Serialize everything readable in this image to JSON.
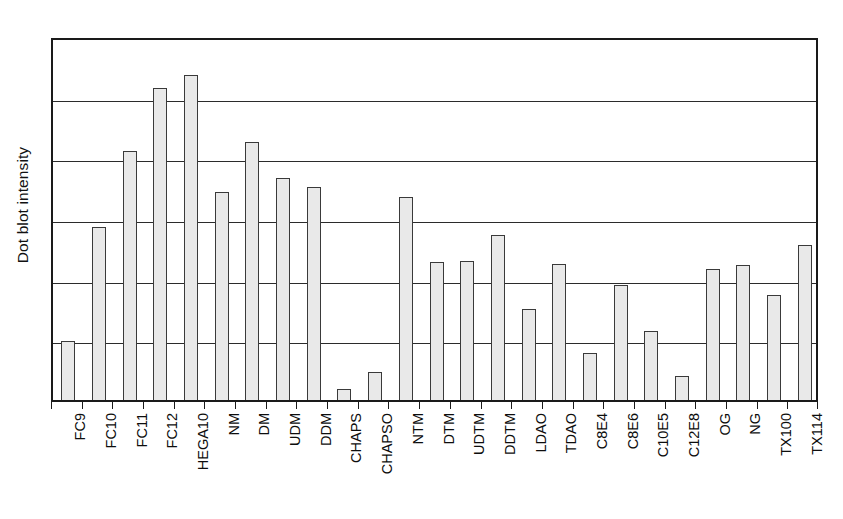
{
  "chart_data": {
    "type": "bar",
    "title": "",
    "xlabel": "",
    "ylabel": "Dot blot intensity",
    "ylim": [
      0,
      6
    ],
    "yticks": [
      0,
      1,
      2,
      3,
      4,
      5,
      6
    ],
    "ytick_labels": [
      "",
      "",
      "",
      "",
      "",
      "",
      ""
    ],
    "grid": true,
    "legend": false,
    "axis_frame": true,
    "bar_fill_color": "#e9e9e9",
    "bar_edge_color": "#3a3a3a",
    "axis_color": "#1a1a1a",
    "gridline_color": "#2b2b2b",
    "categories": [
      "FC9",
      "FC10",
      "FC11",
      "FC12",
      "HEGA10",
      "NM",
      "DM",
      "UDM",
      "DDM",
      "CHAPS",
      "CHAPSO",
      "NTM",
      "DTM",
      "UDTM",
      "DDTM",
      "LDAO",
      "TDAO",
      "C8E4",
      "C8E6",
      "C10E5",
      "C12E8",
      "OG",
      "NG",
      "TX100",
      "TX114"
    ],
    "values": [
      0.97,
      2.85,
      4.11,
      5.14,
      5.35,
      3.43,
      4.25,
      3.66,
      3.51,
      0.18,
      0.46,
      3.34,
      2.27,
      2.29,
      2.72,
      1.5,
      2.24,
      0.77,
      1.9,
      1.14,
      0.4,
      2.16,
      2.22,
      1.73,
      2.55
    ],
    "series": [
      {
        "name": "Dot blot intensity",
        "values": [
          0.97,
          2.85,
          4.11,
          5.14,
          5.35,
          3.43,
          4.25,
          3.66,
          3.51,
          0.18,
          0.46,
          3.34,
          2.27,
          2.29,
          2.72,
          1.5,
          2.24,
          0.77,
          1.9,
          1.14,
          0.4,
          2.16,
          2.22,
          1.73,
          2.55
        ]
      }
    ]
  }
}
